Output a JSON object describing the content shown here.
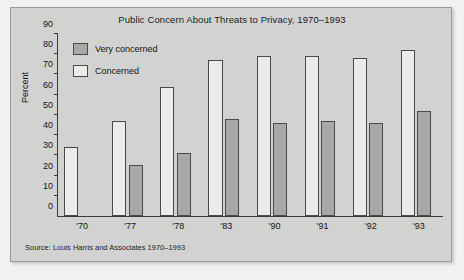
{
  "chart_data": {
    "type": "bar",
    "title": "Public Concern About Threats to Privacy, 1970–1993",
    "xlabel": "",
    "ylabel": "Percent",
    "ylim": [
      0,
      90
    ],
    "ytick_step": 10,
    "yticks": [
      90,
      80,
      70,
      60,
      50,
      40,
      30,
      20,
      10,
      0
    ],
    "grid": false,
    "legend_position": "upper-left-inside",
    "categories": [
      "'70",
      "'77",
      "'78",
      "'83",
      "'90",
      "'91",
      "'92",
      "'93"
    ],
    "series": [
      {
        "name": "Concerned",
        "color": "#ebebe9",
        "values": [
          34,
          47,
          64,
          77,
          79,
          79,
          78,
          82
        ]
      },
      {
        "name": "Very concerned",
        "color": "#a8a8a6",
        "values": [
          null,
          25,
          31,
          48,
          46,
          47,
          46,
          52
        ]
      }
    ],
    "source": "Source: Louis Harris and Associates 1970–1993"
  },
  "legend": {
    "items": [
      {
        "label": "Very concerned",
        "swatch": "very-concerned"
      },
      {
        "label": "Concerned",
        "swatch": "concerned"
      }
    ]
  },
  "colors": {
    "panel_background": "#d2d2d0",
    "page_background": "#f2f1ef",
    "axis": "#3a3a3a",
    "bar_border": "#4a4a4a",
    "concerned_fill": "#ebebe9",
    "very_concerned_fill": "#a8a8a6",
    "text": "#121212"
  }
}
